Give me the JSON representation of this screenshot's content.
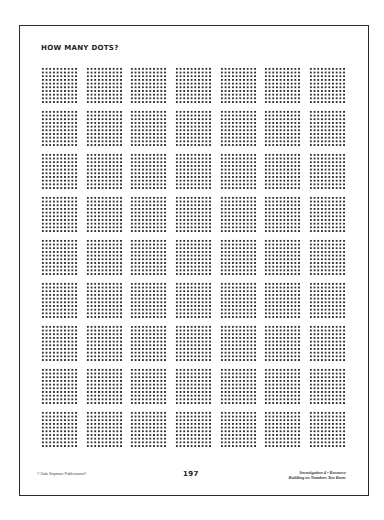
{
  "page": {
    "title": "HOW MANY DOTS?",
    "page_number": "197",
    "copyright": "© Dale Seymour Publications®",
    "footer": {
      "line1": "Investigation 4 • Resource",
      "line2": "Building on Numbers You Know"
    }
  },
  "dot_grid": {
    "rows": 9,
    "columns": 7,
    "dots_per_square_side": 10,
    "dots_per_square": 100,
    "total_squares": 63,
    "column_x": [
      41,
      86,
      130,
      175,
      220,
      264,
      309
    ],
    "row_y": [
      67,
      110,
      153,
      196,
      239,
      282,
      325,
      368,
      411
    ],
    "square_size_px": 37,
    "dot_color": "#303030"
  },
  "colors": {
    "background": "#ffffff",
    "border": "#2a2a2a",
    "text": "#222222"
  }
}
